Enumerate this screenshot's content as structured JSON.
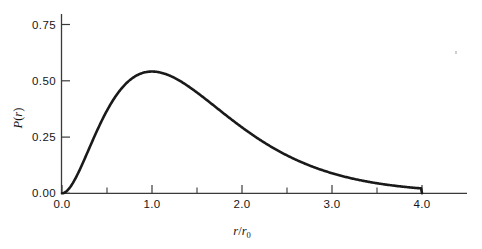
{
  "figure": {
    "background_color": "#ffffff",
    "curve_color": "#1a1a1a",
    "axis_color": "#3a3a3a",
    "text_color": "#161616"
  },
  "axes": {
    "y": {
      "label_main": "P",
      "label_paren_open": "(",
      "label_var": "r",
      "label_paren_close": ")",
      "label_text": "P(r)",
      "ticks": [
        {
          "value": 0.75,
          "label": "0.75"
        },
        {
          "value": 0.5,
          "label": "0.50"
        },
        {
          "value": 0.25,
          "label": "0.25"
        },
        {
          "value": 0.0,
          "label": "0.00"
        }
      ],
      "range": [
        0.0,
        0.85
      ]
    },
    "x": {
      "label_num": "r",
      "label_slash": "/",
      "label_den": "r",
      "label_sub": "0",
      "label_text": "r/r0",
      "ticks": [
        {
          "value": 0.0,
          "label": "0.0"
        },
        {
          "value": 1.0,
          "label": "1.0"
        },
        {
          "value": 2.0,
          "label": "2.0"
        },
        {
          "value": 3.0,
          "label": "3.0"
        },
        {
          "value": 4.0,
          "label": "4.0"
        }
      ],
      "minor_ticks": [
        0.5,
        1.5,
        2.5,
        3.5
      ],
      "range": [
        0.0,
        4.5
      ]
    }
  },
  "chart_data": {
    "type": "line",
    "title": "",
    "subtitle": "",
    "xlabel": "r/r0",
    "ylabel": "P(r)",
    "xlim": [
      0.0,
      4.5
    ],
    "ylim": [
      0.0,
      0.85
    ],
    "grid": false,
    "legend": null,
    "annotations": [],
    "series": [
      {
        "name": "P(r)",
        "x": [
          0.0,
          0.1,
          0.2,
          0.3,
          0.4,
          0.5,
          0.6,
          0.7,
          0.8,
          0.9,
          1.0,
          1.1,
          1.2,
          1.3,
          1.4,
          1.5,
          1.6,
          1.7,
          1.8,
          1.9,
          2.0,
          2.1,
          2.2,
          2.3,
          2.4,
          2.5,
          2.6,
          2.7,
          2.8,
          2.9,
          3.0,
          3.1,
          3.2,
          3.3,
          3.4,
          3.5,
          3.6,
          3.7,
          3.8,
          3.9,
          4.0
        ],
        "values": [
          0.0,
          0.004,
          0.015,
          0.033,
          0.056,
          0.081,
          0.109,
          0.136,
          0.163,
          0.188,
          0.211,
          0.231,
          0.248,
          0.262,
          0.272,
          0.28,
          0.284,
          0.286,
          0.285,
          0.282,
          0.277,
          0.27,
          0.262,
          0.252,
          0.242,
          0.231,
          0.219,
          0.207,
          0.195,
          0.183,
          0.171,
          0.159,
          0.148,
          0.137,
          0.126,
          0.116,
          0.106,
          0.097,
          0.088,
          0.08,
          0.0
        ]
      }
    ],
    "peak": {
      "x": 1.02,
      "y": 0.541
    },
    "endpoints": [
      {
        "x": 0.0,
        "y": 0.0
      },
      {
        "x": 4.0,
        "y": 0.0
      }
    ]
  }
}
